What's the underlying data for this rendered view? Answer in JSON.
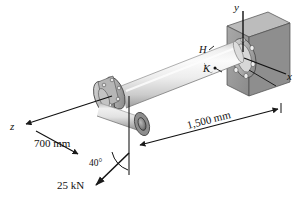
{
  "figure": {
    "background_color": "#ffffff",
    "line_color": "#1a1a1a"
  },
  "axes": {
    "y_label": "y",
    "x_label": "x",
    "z_label": "z"
  },
  "points": {
    "h_label": "H",
    "k_label": "K"
  },
  "dimensions": {
    "left_length": "700 mm",
    "right_length": "1,500 mm"
  },
  "load": {
    "magnitude_label": "25 kN",
    "angle_label": "40°"
  },
  "colors": {
    "wall_face": "#9a9a9a",
    "wall_side": "#6f6f6f",
    "wall_top": "#b5b5b5",
    "shaft_light": "#f2f2f2",
    "shaft_mid": "#d2d2d2",
    "shaft_dark": "#9e9e9e",
    "flange": "#a8a8a8",
    "hub_dark": "#555555"
  }
}
